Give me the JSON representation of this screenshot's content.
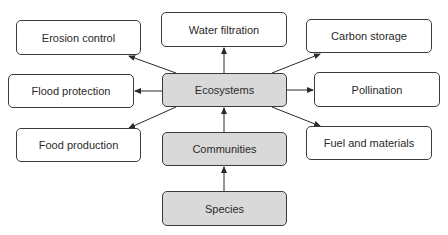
{
  "colors": {
    "border": "#3a3a3a",
    "core_fill": "#d9d9d9",
    "service_fill": "#ffffff",
    "arrow": "#2a2a2a",
    "text": "#2a2a2a"
  },
  "nodes": {
    "species": {
      "label": "Species",
      "type": "core",
      "box": [
        162,
        191,
        125,
        35
      ]
    },
    "communities": {
      "label": "Communities",
      "type": "core",
      "box": [
        162,
        132,
        125,
        34
      ]
    },
    "ecosystems": {
      "label": "Ecosystems",
      "type": "core",
      "box": [
        162,
        73,
        125,
        34
      ]
    },
    "water_filtration": {
      "label": "Water filtration",
      "type": "service",
      "box": [
        161,
        12,
        126,
        35
      ]
    },
    "erosion_control": {
      "label": "Erosion control",
      "type": "service",
      "box": [
        16,
        20,
        125,
        35
      ]
    },
    "flood_protection": {
      "label": "Flood protection",
      "type": "service",
      "box": [
        8,
        74,
        126,
        34
      ]
    },
    "food_production": {
      "label": "Food production",
      "type": "service",
      "box": [
        16,
        128,
        125,
        34
      ]
    },
    "carbon_storage": {
      "label": "Carbon storage",
      "type": "service",
      "box": [
        306,
        19,
        126,
        34
      ]
    },
    "pollination": {
      "label": "Pollination",
      "type": "service",
      "box": [
        314,
        72,
        126,
        35
      ]
    },
    "fuel_and_materials": {
      "label": "Fuel and materials",
      "type": "service",
      "box": [
        306,
        126,
        126,
        34
      ]
    }
  },
  "edges": [
    {
      "from": "species",
      "to": "communities",
      "points": [
        224,
        191,
        224,
        167
      ]
    },
    {
      "from": "communities",
      "to": "ecosystems",
      "points": [
        224,
        132,
        224,
        108
      ]
    },
    {
      "from": "ecosystems",
      "to": "water_filtration",
      "points": [
        224,
        73,
        224,
        48
      ]
    },
    {
      "from": "ecosystems",
      "to": "erosion_control",
      "points": [
        176,
        73,
        129,
        56
      ]
    },
    {
      "from": "ecosystems",
      "to": "flood_protection",
      "points": [
        162,
        91,
        135,
        91
      ]
    },
    {
      "from": "ecosystems",
      "to": "food_production",
      "points": [
        176,
        107,
        129,
        128
      ]
    },
    {
      "from": "ecosystems",
      "to": "carbon_storage",
      "points": [
        272,
        73,
        320,
        54
      ]
    },
    {
      "from": "ecosystems",
      "to": "pollination",
      "points": [
        287,
        90,
        313,
        90
      ]
    },
    {
      "from": "ecosystems",
      "to": "fuel_and_materials",
      "points": [
        272,
        107,
        320,
        126
      ]
    }
  ]
}
